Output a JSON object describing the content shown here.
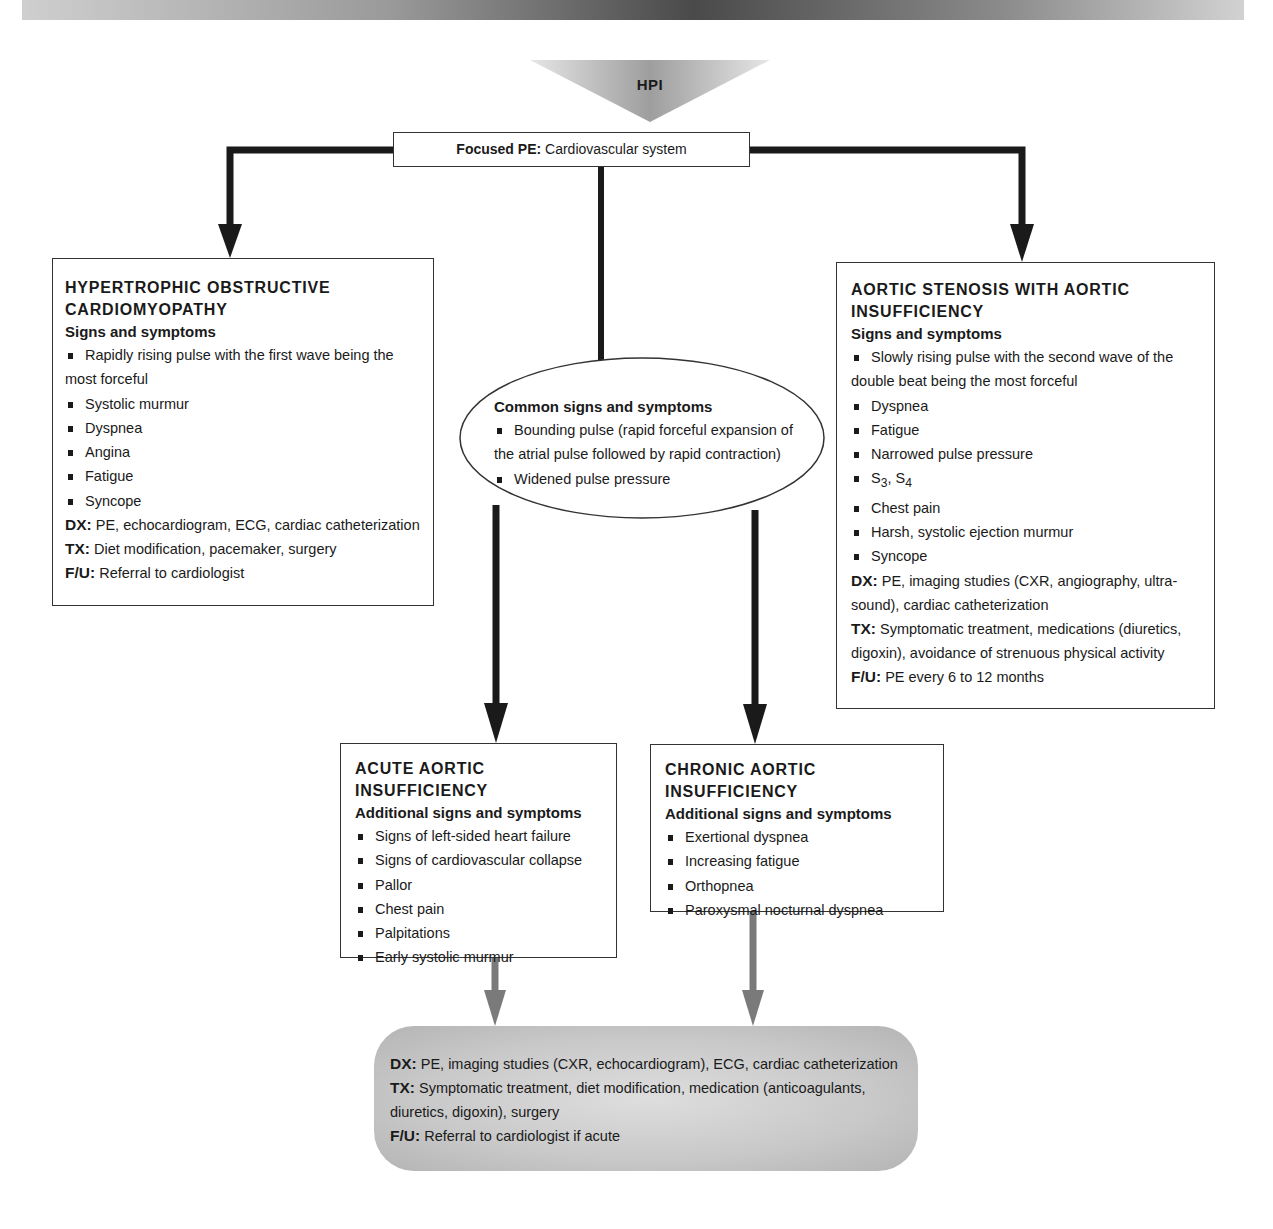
{
  "header": {
    "banner": ""
  },
  "hpi": {
    "label": "HPI"
  },
  "focused_pe": {
    "label": "Focused PE:",
    "value": "Cardiovascular system"
  },
  "hocm": {
    "title_line1": "HYPERTROPHIC OBSTRUCTIVE",
    "title_line2": "CARDIOMYOPATHY",
    "subtitle": "Signs and symptoms",
    "items": [
      "Rapidly rising pulse with the first wave being the most forceful",
      "Systolic murmur",
      "Dyspnea",
      "Angina",
      "Fatigue",
      "Syncope"
    ],
    "dx_label": "DX:",
    "dx": "PE, echocardiogram, ECG, cardiac catheterization",
    "tx_label": "TX:",
    "tx": "Diet modification, pacemaker, surgery",
    "fu_label": "F/U:",
    "fu": "Referral to cardiologist"
  },
  "common": {
    "title": "Common signs and symptoms",
    "items": [
      "Bounding pulse (rapid forceful expansion of the atrial pulse followed by rapid contraction)",
      "Widened pulse pressure"
    ]
  },
  "asai": {
    "title_line1": "AORTIC STENOSIS WITH AORTIC",
    "title_line2": "INSUFFICIENCY",
    "subtitle": "Signs and symptoms",
    "items": [
      "Slowly rising pulse with the second wave of the double beat being the most forceful",
      "Dyspnea",
      "Fatigue",
      "Narrowed pulse pressure",
      "S3, S4",
      "Chest pain",
      "Harsh, systolic ejection murmur",
      "Syncope"
    ],
    "s3": "S",
    "s3_sub": "3",
    "s4": "S",
    "s4_sub": "4",
    "dx_label": "DX:",
    "dx": "PE, imaging studies (CXR, angiography, ultra-sound), cardiac catheterization",
    "tx_label": "TX:",
    "tx": "Symptomatic treatment, medications (diuretics, digoxin), avoidance of strenuous physical activity",
    "fu_label": "F/U:",
    "fu": "PE every 6 to 12 months"
  },
  "acute": {
    "title": "ACUTE AORTIC INSUFFICIENCY",
    "subtitle": "Additional signs and symptoms",
    "items": [
      "Signs of left-sided heart failure",
      "Signs of cardiovascular collapse",
      "Pallor",
      "Chest pain",
      "Palpitations",
      "Early systolic murmur"
    ]
  },
  "chronic": {
    "title": "CHRONIC AORTIC INSUFFICIENCY",
    "subtitle": "Additional signs and symptoms",
    "items": [
      "Exertional dyspnea",
      "Increasing fatigue",
      "Orthopnea",
      "Paroxysmal nocturnal dyspnea"
    ]
  },
  "outcome": {
    "dx_label": "DX:",
    "dx": "PE, imaging studies (CXR, echocardiogram), ECG, cardiac catheterization",
    "tx_label": "TX:",
    "tx": "Symptomatic treatment, diet modification, medication (anticoagulants, diuretics, digoxin), surgery",
    "fu_label": "F/U:",
    "fu": "Referral to cardiologist if acute"
  },
  "colors": {
    "line_dark": "#1a1a1a",
    "line_gray": "#7a7a7a",
    "outcome_fill": "#c8c8c8",
    "hpi_fill": "#b8b8b8"
  }
}
